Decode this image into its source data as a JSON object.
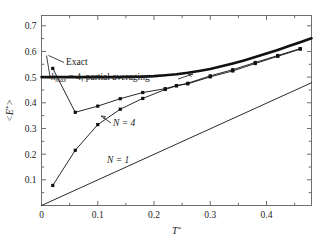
{
  "chart_data": {
    "type": "line",
    "title": "",
    "xlabel": "T*",
    "ylabel": "<E*>",
    "xlim": [
      0,
      0.48
    ],
    "ylim": [
      0,
      0.74
    ],
    "xticks": [
      0,
      0.1,
      0.2,
      0.3,
      0.4
    ],
    "xticklabels": [
      "0",
      "0.1",
      "0.2",
      "0.3",
      "0.4"
    ],
    "xminorticks": [
      0.05,
      0.15,
      0.25,
      0.35,
      0.45
    ],
    "yticks": [
      0.1,
      0.2,
      0.3,
      0.4,
      0.5,
      0.6,
      0.7
    ],
    "yticklabels": [
      "0.1",
      "0.2",
      "0.3",
      "0.4",
      "0.5",
      "0.6",
      "0.7"
    ],
    "grid": false,
    "legend": "inline-annotations",
    "series": [
      {
        "name": "Exact",
        "style": "thick-line",
        "markers": false,
        "x": [
          0.0,
          0.02,
          0.04,
          0.06,
          0.08,
          0.1,
          0.12,
          0.14,
          0.16,
          0.18,
          0.2,
          0.22,
          0.24,
          0.26,
          0.28,
          0.3,
          0.32,
          0.34,
          0.36,
          0.38,
          0.4,
          0.42,
          0.44,
          0.46,
          0.48
        ],
        "y": [
          0.5,
          0.5,
          0.5,
          0.5,
          0.5,
          0.5,
          0.5,
          0.5,
          0.501,
          0.502,
          0.504,
          0.507,
          0.511,
          0.517,
          0.524,
          0.532,
          0.542,
          0.553,
          0.565,
          0.578,
          0.592,
          0.606,
          0.621,
          0.636,
          0.651
        ]
      },
      {
        "name": "kmax = 4, partial averaging",
        "style": "thin-line-markers",
        "markers": true,
        "x": [
          0.02,
          0.06,
          0.1,
          0.14,
          0.18,
          0.22,
          0.24,
          0.26,
          0.3,
          0.34,
          0.38,
          0.42,
          0.46
        ],
        "y": [
          0.534,
          0.363,
          0.387,
          0.416,
          0.44,
          0.455,
          0.467,
          0.474,
          0.501,
          0.524,
          0.553,
          0.581,
          0.609
        ]
      },
      {
        "name": "N = 4",
        "style": "thin-line-markers",
        "markers": true,
        "x": [
          0.02,
          0.06,
          0.1,
          0.14,
          0.18,
          0.22,
          0.24,
          0.26,
          0.3,
          0.34,
          0.38,
          0.42,
          0.46
        ],
        "y": [
          0.078,
          0.215,
          0.315,
          0.375,
          0.417,
          0.452,
          0.466,
          0.476,
          0.505,
          0.529,
          0.557,
          0.584,
          0.611
        ]
      },
      {
        "name": "N = 1",
        "style": "thin-line",
        "markers": false,
        "x": [
          0.0,
          0.48
        ],
        "y": [
          0.0,
          0.478
        ]
      }
    ],
    "annotations": [
      {
        "id": "exact-label",
        "text": "Exact",
        "x_px": 66,
        "y_px": 65
      },
      {
        "id": "kmax-label",
        "text_prefix": "k",
        "text_sub": "max",
        "text_suffix": " = 4, partial averaging",
        "x_px": 51,
        "y_px": 80
      },
      {
        "id": "n4-label",
        "text": "N = 4",
        "x_px": 113,
        "y_px": 126
      },
      {
        "id": "n1-label",
        "text": "N = 1",
        "x_px": 107,
        "y_px": 163
      }
    ]
  }
}
